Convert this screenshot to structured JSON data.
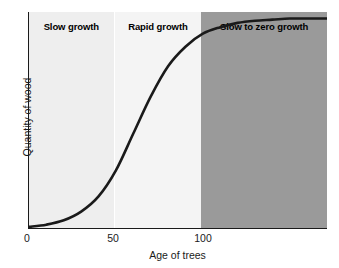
{
  "chart_data": {
    "type": "line",
    "title": "",
    "xlabel": "Age of trees",
    "ylabel": "Quantity of wood",
    "xlim": [
      0,
      172
    ],
    "ylim": [
      0,
      100
    ],
    "xticks": [
      "0",
      "50",
      "100"
    ],
    "xtick_values": [
      0,
      50,
      100
    ],
    "yticks": [],
    "grid": false,
    "legend": "none",
    "series": [
      {
        "name": "Quantity of wood",
        "color": "#1a1a1a",
        "x": [
          0,
          10,
          20,
          30,
          40,
          50,
          60,
          70,
          80,
          90,
          100,
          110,
          120,
          130,
          140,
          150,
          160,
          172
        ],
        "y": [
          1,
          2,
          4,
          8,
          15,
          27,
          44,
          61,
          75,
          84,
          90,
          93,
          95,
          96,
          96.5,
          97,
          97,
          97
        ]
      }
    ],
    "bands": [
      {
        "label": "Slow growth",
        "x_start": 0,
        "x_end": 50,
        "color": "#eeeeee",
        "label_color": "#000000"
      },
      {
        "label": "Rapid growth",
        "x_start": 50,
        "x_end": 100,
        "color": "#f4f4f4",
        "label_color": "#000000"
      },
      {
        "label": "Slow to zero growth",
        "x_start": 100,
        "x_end": 172,
        "color": "#9a9a9a",
        "label_color": "#000000"
      }
    ]
  },
  "axes": {
    "x_title": "Age of trees",
    "y_title": "Quantity of wood",
    "x_tick_0": "0",
    "x_tick_50": "50",
    "x_tick_100": "100"
  },
  "bands": {
    "slow_growth": "Slow growth",
    "rapid_growth": "Rapid growth",
    "slow_to_zero_growth": "Slow to zero growth"
  },
  "colors": {
    "band_slow_growth": "#eeeeee",
    "band_rapid_growth": "#f4f4f4",
    "band_slow_to_zero_growth": "#9a9a9a",
    "curve": "#1a1a1a",
    "axis": "#1a1a1a",
    "text": "#1a1a1a"
  }
}
